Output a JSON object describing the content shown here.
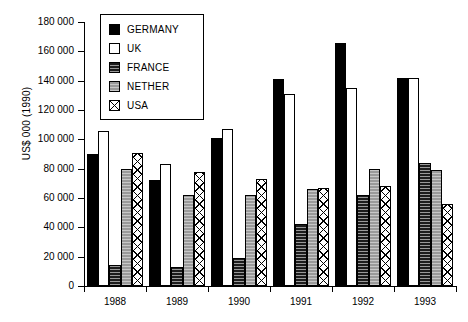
{
  "chart_data": {
    "type": "bar",
    "title": "",
    "subtitle": "",
    "xlabel": "",
    "ylabel": "US$ 000 (1990)",
    "ylim": [
      0,
      180000
    ],
    "ytick_labels": [
      "180 000",
      "160 000",
      "140 000",
      "120 000",
      "100 000",
      "80 000",
      "60 000",
      "40 000",
      "20 000",
      "0"
    ],
    "ytick_values": [
      180000,
      160000,
      140000,
      120000,
      100000,
      80000,
      60000,
      40000,
      20000,
      0
    ],
    "ytick_step": 20000,
    "grid": false,
    "legend_position": "top-left-inside",
    "categories": [
      "1988",
      "1989",
      "1990",
      "1991",
      "1992",
      "1993"
    ],
    "series": [
      {
        "name": "GERMANY",
        "color": "#000000",
        "pattern": "solid-black",
        "values": [
          90000,
          72000,
          101000,
          141000,
          166000,
          142000
        ]
      },
      {
        "name": "UK",
        "color": "#ffffff",
        "pattern": "solid-white",
        "values": [
          106000,
          83000,
          107000,
          131000,
          135000,
          142000
        ]
      },
      {
        "name": "FRANCE",
        "color": "#1c1c1c",
        "pattern": "dense-dark",
        "values": [
          14000,
          13000,
          19000,
          42000,
          62000,
          84000
        ]
      },
      {
        "name": "NETHER",
        "color": "#9a9a9a",
        "pattern": "stipple-gray",
        "values": [
          80000,
          62000,
          62000,
          66000,
          80000,
          79000
        ]
      },
      {
        "name": "USA",
        "color": "#ffffff",
        "pattern": "crosshatch",
        "values": [
          91000,
          78000,
          73000,
          67000,
          68000,
          56000
        ]
      }
    ]
  },
  "legend": {
    "items": [
      {
        "label": "GERMANY",
        "swatch": "legend-swatch-germany"
      },
      {
        "label": "UK",
        "swatch": "legend-swatch-uk"
      },
      {
        "label": "FRANCE",
        "swatch": "legend-swatch-france"
      },
      {
        "label": "NETHER",
        "swatch": "legend-swatch-nether"
      },
      {
        "label": "USA",
        "swatch": "legend-swatch-usa"
      }
    ]
  }
}
